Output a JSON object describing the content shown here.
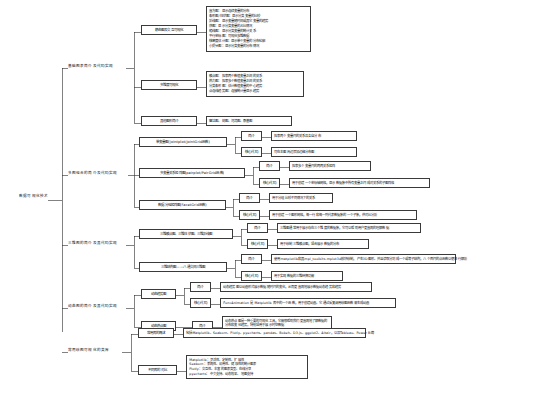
{
  "diagram": {
    "type": "mind-map",
    "title": "数据可视化技术",
    "root": {
      "label": "数据可视化技术"
    },
    "branches": [
      {
        "id": "b1",
        "label": "基础图表简介及代码实现",
        "children": [
          {
            "id": "b1c1",
            "label": "静态图及交互可视化",
            "detail_lines": [
              "直方图：显示连续变量的分布",
              "条形图/柱状图：显示分类变量的比较",
              "折线图：显示变量随时间或其它变量的趋势",
              "饼图：显示分类变量的占比情况",
              "箱线图：显示分类变量的统计关系",
              "平行坐标图：可视化多维数据",
              "核密度估计图：显示单个变量的分布轮廓",
              "小提琴图：显示分类变量的分布情况"
            ]
          },
          {
            "id": "b1c2",
            "label": "多维度可视化",
            "detail_lines": [
              "散点图：探索两个数值变量之间的关系",
              "热力图：探索多个数值变量之间的关系",
              "分类条形图：估计数值变量的中心趋势",
              "点连线趋势图：连接统计量显示趋势"
            ]
          },
          {
            "id": "b1c3",
            "label": "其他图形简介",
            "detail_lines": [
              "雷达图、树图、河流图、桑基图"
            ]
          }
        ]
      },
      {
        "id": "b2",
        "label": "多图组合的简介及代码实现",
        "children": [
          {
            "id": "b2c1",
            "label": "单变量图(jointplot/JointGrid函数)",
            "subs": [
              {
                "label": "简介",
                "text": "探索两个变量间的关系及各自分布"
              },
              {
                "label": "核心代码",
                "text": "可在主图周边添加边缘分布图"
              }
            ]
          },
          {
            "id": "b2c2",
            "label": "多变量关系矩阵图(pairplot/PairGrid函数)",
            "subs": [
              {
                "label": "简介",
                "text": "探索多个变量间的两两关系矩阵"
              },
              {
                "label": "核心代码",
                "text": "用于创建一个坐标轴网格，显示数据集中所有变量之间成对关系的子图阵格"
              }
            ]
          },
          {
            "id": "b2c3",
            "label": "数据分组矩阵图(FacetGrid函数)",
            "subs": [
              {
                "label": "简介",
                "text": "用于分组比较不同情况下的关系"
              },
              {
                "label": "核心代码",
                "text": "用于创建一个图形网格，每一行和每一列代表数据集的一个子集，供对比分析"
              }
            ]
          }
        ]
      },
      {
        "id": "b3",
        "label": "三维图的简介及其代码实现",
        "children": [
          {
            "id": "b3c1",
            "label": "三维散点图、三维柱状图、三维折线图",
            "subs": [
              {
                "label": "简介",
                "text": "三维图通常用于展示存在三个维度的数据集，它可以帮助用户更直观的理解数据"
              },
              {
                "label": "核心代码",
                "text": "用于绘制三维散点图，适合展示数据的分布"
              }
            ]
          },
          {
            "id": "b3c2",
            "label": "三维结构图——八通交间三维图",
            "subs": [
              {
                "label": "简介",
                "text": "使用matplotlib和其mpl_toolkits.mplot3d模块绘制，产生3D图形。并且读取分割成一个或等子结构，八个面间的点函数以便进行解析"
              },
              {
                "label": "核心代码",
                "text": "用于实现数据的三维转换功能"
              }
            ]
          }
        ]
      },
      {
        "id": "b4",
        "label": "动态图的简介及其代码实现",
        "children": [
          {
            "id": "b4c1",
            "label": "动态趋势图",
            "subs": [
              {
                "label": "简介",
                "text": "动态趋势图以动画形式展示数据随时间的变化，从而更直观地展示数据动态趋势和趋势"
              },
              {
                "label": "核心代码",
                "text": "FuncAnimation 是 Matplotlib 库中的一个函数，用于创建动画。它通过反复调用绘图函数来生成动画"
              }
            ]
          },
          {
            "id": "b4c2",
            "label": "动态热点图",
            "subs": [
              {
                "label": "简介",
                "text": "动态热点图是一种重要的可视化工具，它能够帮助我们更直观地了解数据的分布和变化趋势，特别适用于展示时空数据"
              }
            ]
          }
        ]
      },
      {
        "id": "b5",
        "label": "常用绘图可视化的类库",
        "children": [
          {
            "id": "b5c1",
            "label": "常用库的概述",
            "detail_lines": [
              "包括Matplotlib、Seaborn、Plotly、pyecharts、pandas、Bokeh、D3.js、ggplot2、Altair，以及Tableau、Power BI等"
            ]
          },
          {
            "id": "b5c2",
            "label": "不同库的对比",
            "detail_lines": [
              "Matplotlib：灵活性、定制性、扩展性",
              "Seaborn：美观性、易用性、健康性的统计图表",
              "Plotly：交互性、丰富的图表类型、在线分享",
              "pyecharts：中文支持、动态效果、地图支持"
            ]
          }
        ]
      }
    ]
  }
}
